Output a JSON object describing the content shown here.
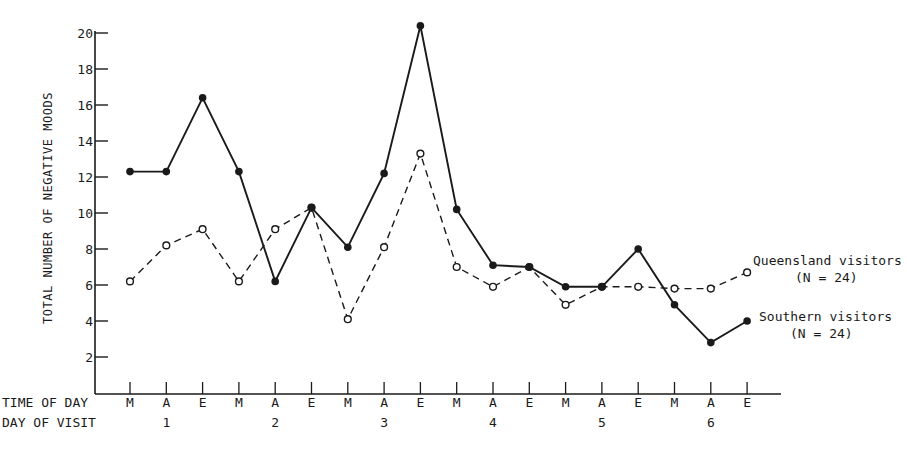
{
  "chart_data": {
    "type": "line",
    "title": "",
    "ylabel": "TOTAL NUMBER OF NEGATIVE MOODS",
    "xlabel_rows": [
      "TIME OF DAY",
      "DAY OF VISIT"
    ],
    "ylim": [
      0,
      20
    ],
    "yticks": [
      2,
      4,
      6,
      8,
      10,
      12,
      14,
      16,
      18,
      20
    ],
    "grid": false,
    "x": [
      "M",
      "A",
      "E",
      "M",
      "A",
      "E",
      "M",
      "A",
      "E",
      "M",
      "A",
      "E",
      "M",
      "A",
      "E",
      "M",
      "A",
      "E"
    ],
    "days": [
      {
        "label": "1",
        "index": 1
      },
      {
        "label": "2",
        "index": 4
      },
      {
        "label": "3",
        "index": 7
      },
      {
        "label": "4",
        "index": 10
      },
      {
        "label": "5",
        "index": 13
      },
      {
        "label": "6",
        "index": 16
      }
    ],
    "series": [
      {
        "name": "Southern visitors",
        "n_label": "(N = 24)",
        "style": "solid",
        "marker": "filled-circle",
        "values": [
          12.3,
          12.3,
          16.4,
          12.3,
          6.2,
          10.3,
          8.1,
          12.2,
          20.4,
          10.2,
          7.1,
          7.0,
          5.9,
          5.9,
          8.0,
          4.9,
          2.8,
          4.0
        ]
      },
      {
        "name": "Queensland visitors",
        "n_label": "(N = 24)",
        "style": "dashed",
        "marker": "open-circle",
        "values": [
          6.2,
          8.2,
          9.1,
          6.2,
          9.1,
          10.3,
          4.1,
          8.1,
          13.3,
          7.0,
          5.9,
          7.0,
          4.9,
          5.9,
          5.9,
          5.8,
          5.8,
          6.7
        ]
      }
    ],
    "legend_position": "right, inline at line ends"
  },
  "colors": {
    "ink": "#1a1a1a",
    "background": "#ffffff"
  }
}
